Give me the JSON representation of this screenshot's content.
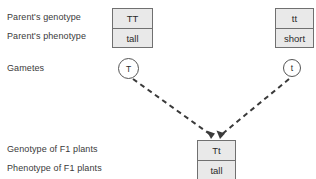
{
  "diagram": {
    "type": "genetic-cross",
    "background_color": "#ffffff",
    "box_fill_color": "#e9e9e9",
    "box_border_color": "#707070",
    "line_color": "#3a3a3a",
    "line_style": "dashed"
  },
  "rows": {
    "parent_genotype_label": "Parent's genotype",
    "parent_phenotype_label": "Parent's phenotype",
    "gametes_label": "Gametes",
    "f1_genotype_label": "Genotype of F1 plants",
    "f1_phenotype_label": "Phenotype of F1 plants"
  },
  "parents": [
    {
      "side": "left",
      "genotype": "TT",
      "phenotype": "tall",
      "gamete": "T"
    },
    {
      "side": "right",
      "genotype": "tt",
      "phenotype": "short",
      "gamete": "t"
    }
  ],
  "offspring": {
    "genotype": "Tt",
    "phenotype": "tall"
  }
}
